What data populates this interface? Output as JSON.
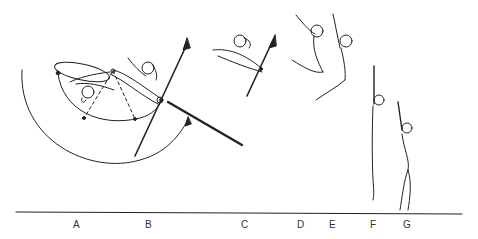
{
  "diagram": {
    "type": "gymnastics-sequence",
    "floor_labels": [
      "A",
      "B",
      "C",
      "D",
      "E",
      "F",
      "G"
    ],
    "colors": {
      "ink": "#222222",
      "background": "#ffffff"
    }
  }
}
